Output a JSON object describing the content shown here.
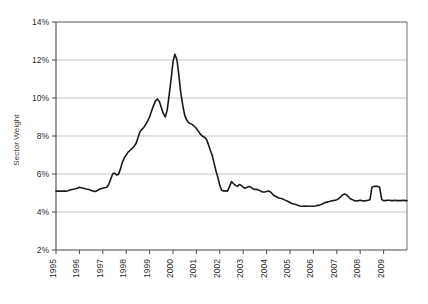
{
  "chart_data": {
    "type": "line",
    "title": "",
    "xlabel": "",
    "ylabel": "Sector Weight",
    "ylim": [
      2,
      14
    ],
    "xlim": [
      1995.0,
      2010.0
    ],
    "grid": true,
    "legend": false,
    "y_ticks": [
      "2%",
      "4%",
      "6%",
      "8%",
      "10%",
      "12%",
      "14%"
    ],
    "y_tick_values": [
      2,
      4,
      6,
      8,
      10,
      12,
      14
    ],
    "x_ticks": [
      "1995",
      "1996",
      "1997",
      "1998",
      "1999",
      "2000",
      "2001",
      "2002",
      "2003",
      "2004",
      "2005",
      "2006",
      "2007",
      "2008",
      "2009"
    ],
    "x_tick_values": [
      1995,
      1996,
      1997,
      1998,
      1999,
      2000,
      2001,
      2002,
      2003,
      2004,
      2005,
      2006,
      2007,
      2008,
      2009
    ],
    "series": [
      {
        "name": "Sector Weight",
        "color": "#1a1a1a",
        "x": [
          1995.0,
          1995.08,
          1995.17,
          1995.25,
          1995.33,
          1995.42,
          1995.5,
          1995.58,
          1995.67,
          1995.75,
          1995.83,
          1995.92,
          1996.0,
          1996.08,
          1996.17,
          1996.25,
          1996.33,
          1996.42,
          1996.5,
          1996.58,
          1996.67,
          1996.75,
          1996.83,
          1996.92,
          1997.0,
          1997.08,
          1997.17,
          1997.25,
          1997.33,
          1997.42,
          1997.5,
          1997.58,
          1997.67,
          1997.75,
          1997.83,
          1997.92,
          1998.0,
          1998.08,
          1998.17,
          1998.25,
          1998.33,
          1998.42,
          1998.5,
          1998.58,
          1998.67,
          1998.75,
          1998.83,
          1998.92,
          1999.0,
          1999.08,
          1999.17,
          1999.25,
          1999.33,
          1999.42,
          1999.5,
          1999.58,
          1999.67,
          1999.75,
          1999.83,
          1999.92,
          2000.0,
          2000.08,
          2000.17,
          2000.25,
          2000.33,
          2000.42,
          2000.5,
          2000.58,
          2000.67,
          2000.75,
          2000.83,
          2000.92,
          2001.0,
          2001.08,
          2001.17,
          2001.25,
          2001.33,
          2001.42,
          2001.5,
          2001.58,
          2001.67,
          2001.75,
          2001.83,
          2001.92,
          2002.0,
          2002.08,
          2002.17,
          2002.25,
          2002.33,
          2002.42,
          2002.5,
          2002.58,
          2002.67,
          2002.75,
          2002.83,
          2002.92,
          2003.0,
          2003.08,
          2003.17,
          2003.25,
          2003.33,
          2003.42,
          2003.5,
          2003.58,
          2003.67,
          2003.75,
          2003.83,
          2003.92,
          2004.0,
          2004.08,
          2004.17,
          2004.25,
          2004.33,
          2004.42,
          2004.5,
          2004.58,
          2004.67,
          2004.75,
          2004.83,
          2004.92,
          2005.0,
          2005.08,
          2005.17,
          2005.25,
          2005.33,
          2005.42,
          2005.5,
          2005.58,
          2005.67,
          2005.75,
          2005.83,
          2005.92,
          2006.0,
          2006.08,
          2006.17,
          2006.25,
          2006.33,
          2006.42,
          2006.5,
          2006.58,
          2006.67,
          2006.75,
          2006.83,
          2006.92,
          2007.0,
          2007.08,
          2007.17,
          2007.25,
          2007.33,
          2007.42,
          2007.5,
          2007.58,
          2007.67,
          2007.75,
          2007.83,
          2007.92,
          2008.0,
          2008.08,
          2008.17,
          2008.25,
          2008.33,
          2008.42,
          2008.5,
          2008.58,
          2008.67,
          2008.75,
          2008.83,
          2008.92,
          2009.0,
          2009.08,
          2009.17,
          2009.25,
          2009.33,
          2009.42,
          2009.5,
          2009.58,
          2009.67,
          2009.75,
          2009.83,
          2009.92,
          2010.0
        ],
        "y": [
          5.1,
          5.1,
          5.1,
          5.1,
          5.1,
          5.1,
          5.12,
          5.15,
          5.18,
          5.2,
          5.22,
          5.25,
          5.3,
          5.28,
          5.25,
          5.22,
          5.2,
          5.18,
          5.13,
          5.1,
          5.08,
          5.12,
          5.18,
          5.22,
          5.25,
          5.28,
          5.3,
          5.45,
          5.7,
          6.0,
          6.05,
          5.95,
          5.98,
          6.25,
          6.6,
          6.85,
          7.0,
          7.15,
          7.25,
          7.35,
          7.45,
          7.6,
          7.9,
          8.2,
          8.35,
          8.45,
          8.6,
          8.8,
          9.0,
          9.3,
          9.6,
          9.85,
          9.95,
          9.8,
          9.5,
          9.2,
          9.0,
          9.35,
          10.1,
          11.0,
          11.9,
          12.3,
          12.0,
          11.2,
          10.3,
          9.6,
          9.1,
          8.85,
          8.7,
          8.65,
          8.6,
          8.5,
          8.4,
          8.25,
          8.1,
          8.0,
          7.95,
          7.85,
          7.6,
          7.3,
          7.0,
          6.6,
          6.2,
          5.8,
          5.4,
          5.15,
          5.1,
          5.12,
          5.1,
          5.35,
          5.6,
          5.5,
          5.4,
          5.35,
          5.45,
          5.4,
          5.3,
          5.25,
          5.3,
          5.35,
          5.3,
          5.22,
          5.18,
          5.2,
          5.15,
          5.1,
          5.05,
          5.05,
          5.08,
          5.1,
          5.05,
          4.95,
          4.85,
          4.8,
          4.75,
          4.72,
          4.7,
          4.65,
          4.6,
          4.55,
          4.5,
          4.45,
          4.42,
          4.4,
          4.35,
          4.32,
          4.3,
          4.3,
          4.32,
          4.3,
          4.3,
          4.3,
          4.3,
          4.32,
          4.35,
          4.35,
          4.4,
          4.45,
          4.5,
          4.52,
          4.55,
          4.58,
          4.6,
          4.62,
          4.65,
          4.7,
          4.8,
          4.9,
          4.95,
          4.9,
          4.8,
          4.7,
          4.65,
          4.6,
          4.58,
          4.6,
          4.62,
          4.6,
          4.58,
          4.6,
          4.62,
          4.65,
          5.3,
          5.35,
          5.35,
          5.35,
          5.3,
          4.65,
          4.6,
          4.6,
          4.62,
          4.62,
          4.6,
          4.6,
          4.62,
          4.6,
          4.6,
          4.6,
          4.62,
          4.6,
          4.6
        ]
      }
    ]
  }
}
